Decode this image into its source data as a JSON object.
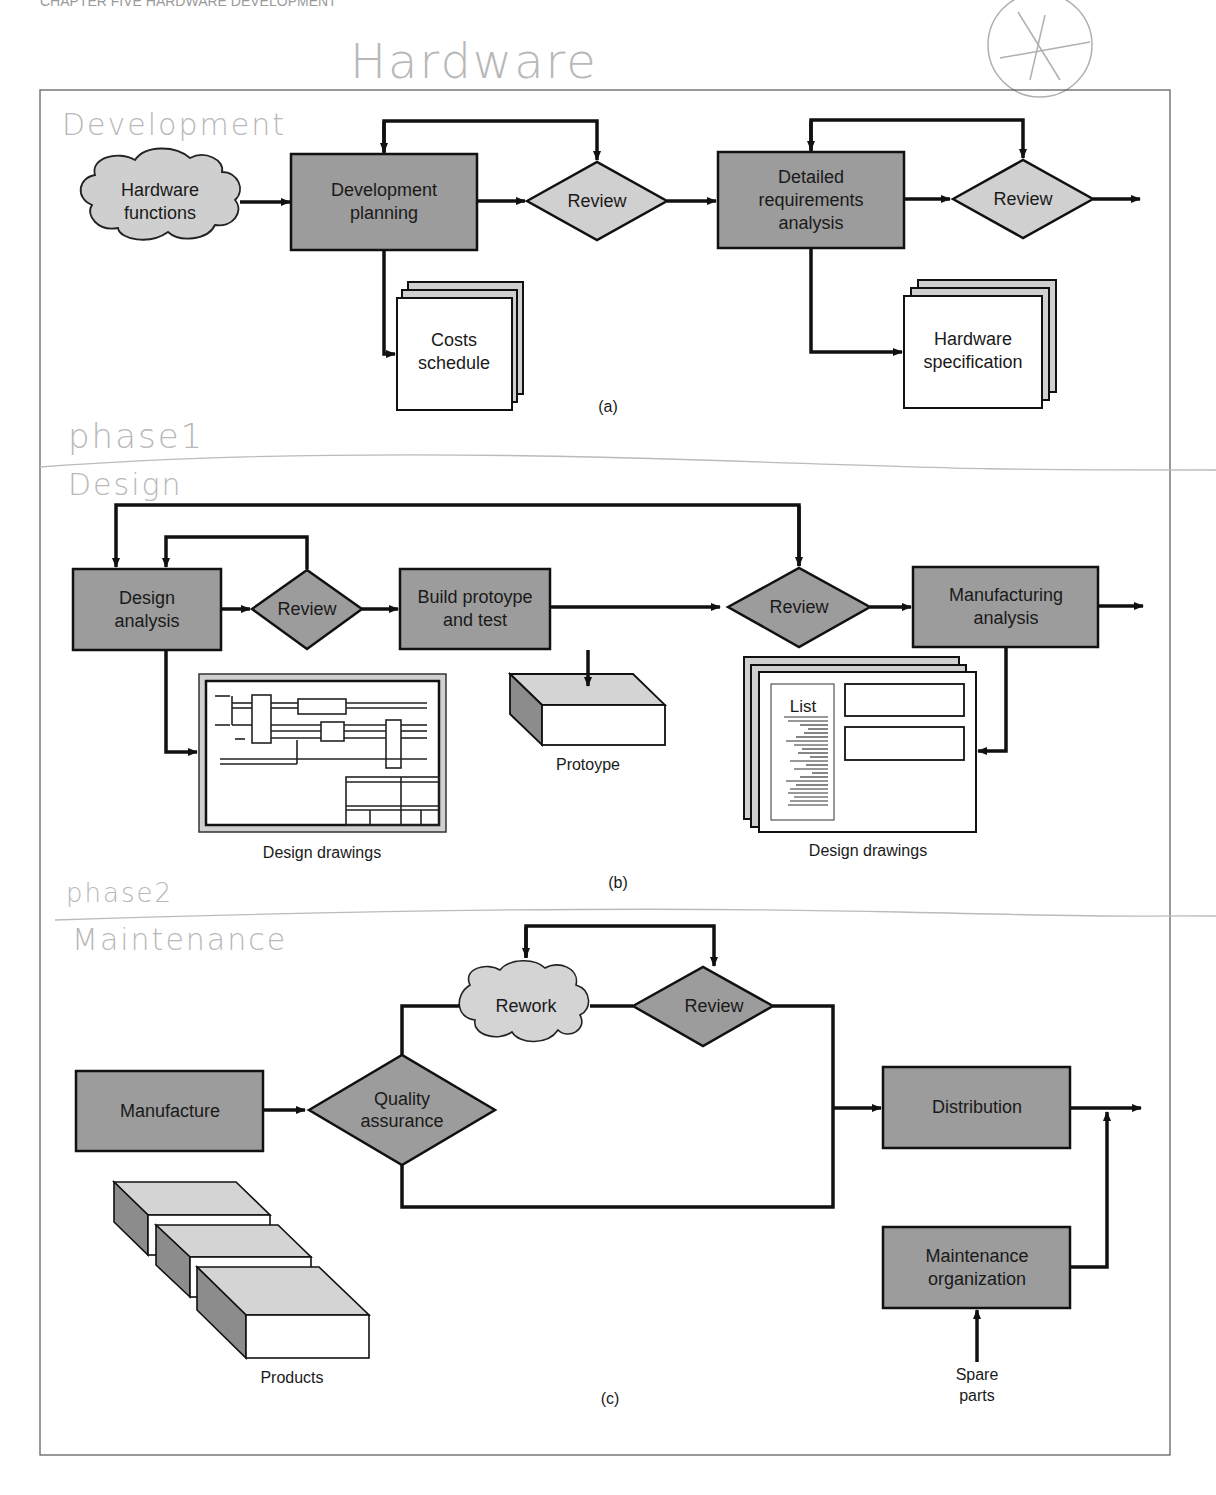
{
  "header": {
    "running_head": "CHAPTER FIVE  HARDWARE DEVELOPMENT",
    "handwritten_title": "Hardware",
    "handwritten_mark": "circled-asterisk"
  },
  "colors": {
    "process_box": "#9c9c9c",
    "review_diamond_a": "#d0d0d0",
    "review_diamond_bc": "#9c9c9c",
    "cloud": "#cfcfcf",
    "stroke": "#111111",
    "handwriting": "#b8b8b8"
  },
  "panel_a": {
    "handwritten_label": "Development",
    "handwritten_phase": "phase1",
    "caption": "(a)",
    "cloud": {
      "line1": "Hardware",
      "line2": "functions"
    },
    "dev_planning": {
      "line1": "Development",
      "line2": "planning"
    },
    "review1": "Review",
    "detailed": {
      "line1": "Detailed",
      "line2": "requirements",
      "line3": "analysis"
    },
    "review2": "Review",
    "costs_doc": {
      "line1": "Costs",
      "line2": "schedule"
    },
    "spec_doc": {
      "line1": "Hardware",
      "line2": "specification"
    }
  },
  "panel_b": {
    "handwritten_label": "Design",
    "handwritten_phase": "phase2",
    "caption": "(b)",
    "design_analysis": {
      "line1": "Design",
      "line2": "analysis"
    },
    "review1": "Review",
    "build": {
      "line1": "Build protoype",
      "line2": "and test"
    },
    "review2": "Review",
    "mfg_analysis": {
      "line1": "Manufacturing",
      "line2": "analysis"
    },
    "drawings_left_caption": "Design drawings",
    "prototype_caption": "Protoype",
    "drawings_right_caption": "Design drawings",
    "list_label": "List"
  },
  "panel_c": {
    "handwritten_label": "Maintenance",
    "caption": "(c)",
    "manufacture": "Manufacture",
    "qa": {
      "line1": "Quality",
      "line2": "assurance"
    },
    "rework": "Rework",
    "review": "Review",
    "distribution": "Distribution",
    "maintenance": {
      "line1": "Maintenance",
      "line2": "organization"
    },
    "spare_parts": {
      "line1": "Spare",
      "line2": "parts"
    },
    "products_caption": "Products"
  }
}
